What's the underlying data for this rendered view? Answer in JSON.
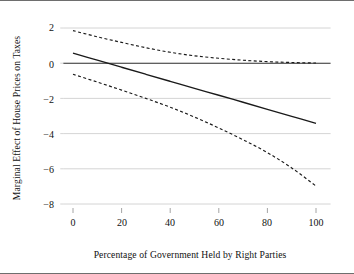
{
  "chart_data": {
    "type": "line",
    "title": "",
    "subtitle": "",
    "xlabel": "Percentage of Government Held by Right Parties",
    "ylabel": "Marginal Effect of House Prices on Taxes",
    "xlim": [
      -4,
      106
    ],
    "ylim": [
      -8.6,
      2.35
    ],
    "xticks": [
      0,
      20,
      40,
      60,
      80,
      100
    ],
    "xticklabels": [
      "0",
      "20",
      "40",
      "60",
      "80",
      "100"
    ],
    "yticks": [
      2,
      0,
      -2,
      -4,
      -6,
      -8
    ],
    "yticklabels": [
      "2",
      "0",
      "−2",
      "−4",
      "−6",
      "−8"
    ],
    "grid": "horizontal",
    "legend": "none",
    "series": [
      {
        "name": "Marginal effect",
        "style": "solid",
        "color": "#1a1a1a",
        "x": [
          0,
          10,
          20,
          30,
          40,
          50,
          60,
          70,
          80,
          90,
          100
        ],
        "values": [
          0.57,
          0.17,
          -0.23,
          -0.63,
          -1.03,
          -1.43,
          -1.82,
          -2.22,
          -2.62,
          -3.02,
          -3.42
        ]
      },
      {
        "name": "Upper 95% confidence bound",
        "style": "dashed",
        "color": "#1a1a1a",
        "x": [
          0,
          10,
          20,
          30,
          40,
          50,
          60,
          70,
          80,
          90,
          100
        ],
        "values": [
          1.85,
          1.5,
          1.18,
          0.88,
          0.62,
          0.42,
          0.28,
          0.17,
          0.09,
          0.04,
          0.01
        ]
      },
      {
        "name": "Lower 95% confidence bound",
        "style": "dashed",
        "color": "#1a1a1a",
        "x": [
          0,
          10,
          20,
          30,
          40,
          50,
          60,
          70,
          80,
          90,
          100
        ],
        "values": [
          -0.63,
          -1.07,
          -1.53,
          -2.0,
          -2.5,
          -3.06,
          -3.68,
          -4.35,
          -5.08,
          -5.95,
          -6.98
        ]
      }
    ]
  },
  "axes": {
    "ylabel": "Marginal Effect of House Prices on Taxes",
    "xlabel": "Percentage of Government Held by Right Parties",
    "ytick_0": "2",
    "ytick_1": "0",
    "ytick_2": "−2",
    "ytick_3": "−4",
    "ytick_4": "−6",
    "ytick_5": "−8",
    "xtick_0": "0",
    "xtick_1": "20",
    "xtick_2": "40",
    "xtick_3": "60",
    "xtick_4": "80",
    "xtick_5": "100"
  },
  "colors": {
    "gridline": "#c9c9c9",
    "line": "#1a1a1a",
    "zero_line": "#2b2b2b",
    "frame": "#6e6e6e",
    "background": "#ffffff"
  }
}
